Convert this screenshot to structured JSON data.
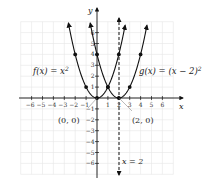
{
  "chart_data": {
    "type": "line",
    "title": "",
    "xlabel": "x",
    "ylabel": "y",
    "xlim": [
      -7,
      7
    ],
    "ylim": [
      -7,
      7
    ],
    "grid": true,
    "x_ticks": [
      -6,
      -5,
      -4,
      -3,
      -2,
      -1,
      1,
      2,
      3,
      4,
      5,
      6
    ],
    "y_ticks": [
      -6,
      -5,
      -4,
      -3,
      -2,
      -1,
      1,
      2,
      3,
      4,
      5,
      6
    ],
    "series": [
      {
        "name": "f(x) = x^2",
        "label": "f(x) = x",
        "label_exp": "2",
        "points": [
          [
            -2,
            4
          ],
          [
            -1,
            1
          ],
          [
            0,
            0
          ],
          [
            1,
            1
          ],
          [
            2,
            4
          ]
        ]
      },
      {
        "name": "g(x) = (x - 2)^2",
        "label": "g(x) = (x − 2)",
        "label_exp": "2",
        "points": [
          [
            0,
            4
          ],
          [
            1,
            1
          ],
          [
            2,
            0
          ],
          [
            3,
            1
          ],
          [
            4,
            4
          ]
        ]
      }
    ],
    "annotations": [
      {
        "text": "(0, 0)",
        "point": [
          0,
          0
        ]
      },
      {
        "text": "(2, 0)",
        "point": [
          2,
          0
        ]
      },
      {
        "text": "x = 2",
        "type": "vertical-asymptote-line",
        "x": 2
      }
    ]
  },
  "labels": {
    "x_axis": "x",
    "y_axis": "y",
    "f_label": "f(x) = x",
    "f_exp": "2",
    "g_label": "g(x) = (x − 2)",
    "g_exp": "2",
    "origin_point": "(0, 0)",
    "vertex_g": "(2, 0)",
    "line_label": "x = 2"
  }
}
